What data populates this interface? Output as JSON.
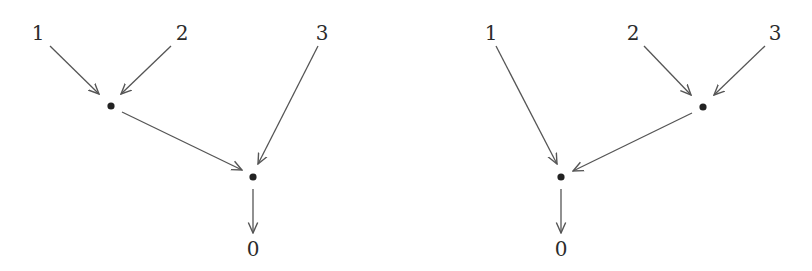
{
  "diagrams": [
    {
      "name": "left-tree",
      "labels": {
        "leaf1": "1",
        "leaf2": "2",
        "leaf3": "3",
        "root": "0"
      },
      "structure": "((1,2),3) -> 0"
    },
    {
      "name": "right-tree",
      "labels": {
        "leaf1": "1",
        "leaf2": "2",
        "leaf3": "3",
        "root": "0"
      },
      "structure": "(1,(2,3)) -> 0"
    }
  ],
  "colors": {
    "edge": "#555555",
    "node": "#222222",
    "text": "#2b2b2b",
    "background": "#ffffff"
  }
}
